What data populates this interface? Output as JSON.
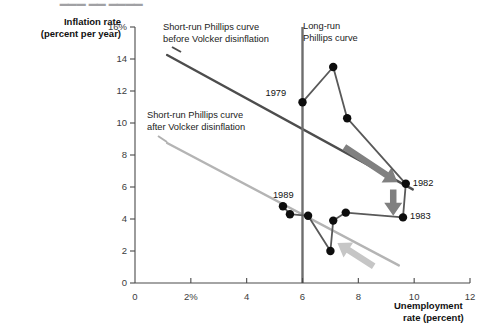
{
  "figure": {
    "width": 487,
    "height": 333,
    "background": "#ffffff"
  },
  "axes": {
    "y_title_line1": "Inflation rate",
    "y_title_line2": "(percent per year)",
    "x_title_line1": "Unemployment",
    "x_title_line2": "rate (percent)",
    "y_ticks": [
      "0",
      "2",
      "4",
      "6",
      "8",
      "10",
      "12",
      "14",
      "16%"
    ],
    "x_ticks": [
      "0",
      "2%",
      "4",
      "6",
      "8",
      "10",
      "12"
    ],
    "axis_color": "#4a4a4a"
  },
  "annotations": {
    "short_run_before_line1": "Short-run Phillips curve",
    "short_run_before_line2": "before Volcker disinflation",
    "short_run_after_line1": "Short-run Phillips curve",
    "short_run_after_line2": "after Volcker disinflation",
    "long_run_line1": "Long-run",
    "long_run_line2": "Phillips curve"
  },
  "point_labels": {
    "y1979": "1979",
    "y1982": "1982",
    "y1983": "1983",
    "y1989": "1989"
  },
  "colors": {
    "data_path": "#595959",
    "dot": "#0d0d0d",
    "short_run_before": "#4d4d4d",
    "short_run_after": "#b4b4b4",
    "long_run": "#6e6e6e",
    "arrow_dark": "#808080",
    "arrow_light": "#c6c6c6"
  },
  "chart_data": {
    "type": "scatter",
    "title": "",
    "xlabel": "Unemployment rate (percent)",
    "ylabel": "Inflation rate (percent per year)",
    "xlim": [
      0,
      12
    ],
    "ylim": [
      0,
      16
    ],
    "grid": false,
    "legend": "none",
    "series": [
      {
        "name": "Inflation-unemployment path 1979-1989",
        "connected": true,
        "points": [
          {
            "label": "1979",
            "x": 6.0,
            "y": 11.3,
            "show_label": true,
            "label_side": "left"
          },
          {
            "label": "",
            "x": 7.1,
            "y": 13.5,
            "show_label": false,
            "label_side": "none"
          },
          {
            "label": "",
            "x": 7.6,
            "y": 10.3,
            "show_label": false,
            "label_side": "none"
          },
          {
            "label": "1982",
            "x": 9.7,
            "y": 6.2,
            "show_label": true,
            "label_side": "right"
          },
          {
            "label": "1983",
            "x": 9.6,
            "y": 4.1,
            "show_label": true,
            "label_side": "right"
          },
          {
            "label": "",
            "x": 7.55,
            "y": 4.4,
            "show_label": false,
            "label_side": "none"
          },
          {
            "label": "",
            "x": 7.1,
            "y": 3.9,
            "show_label": false,
            "label_side": "none"
          },
          {
            "label": "",
            "x": 7.0,
            "y": 2.0,
            "show_label": false,
            "label_side": "none"
          },
          {
            "label": "",
            "x": 6.2,
            "y": 4.2,
            "show_label": false,
            "label_side": "none"
          },
          {
            "label": "",
            "x": 5.55,
            "y": 4.3,
            "show_label": false,
            "label_side": "none"
          },
          {
            "label": "1989",
            "x": 5.3,
            "y": 4.8,
            "show_label": true,
            "label_side": "above-left"
          }
        ]
      }
    ],
    "reference_lines": [
      {
        "name": "Short-run Phillips curve before Volcker disinflation",
        "type": "segment",
        "x0": 1.15,
        "y0": 14.25,
        "x1": 9.95,
        "y1": 5.85,
        "color": "#4d4d4d"
      },
      {
        "name": "Short-run Phillips curve after Volcker disinflation",
        "type": "segment",
        "x0": 1.15,
        "y0": 8.75,
        "x1": 9.45,
        "y1": 1.1,
        "color": "#b4b4b4"
      },
      {
        "name": "Long-run Phillips curve",
        "type": "vertical",
        "x": 6.0,
        "y0": 0.0,
        "y1": 16.0,
        "color": "#6e6e6e"
      }
    ],
    "arrows": [
      {
        "name": "shift-down-arrow-vertical",
        "x0": 9.25,
        "y0": 5.85,
        "x1": 9.25,
        "y1": 4.2,
        "color": "#808080"
      },
      {
        "name": "shift-arrow-upper-curve",
        "x0": 7.5,
        "y0": 8.5,
        "x1": 9.4,
        "y1": 6.3,
        "color": "#808080"
      },
      {
        "name": "shift-arrow-lower-curve",
        "x0": 8.55,
        "y0": 1.05,
        "x1": 7.25,
        "y1": 2.5,
        "color": "#c6c6c6"
      }
    ]
  }
}
